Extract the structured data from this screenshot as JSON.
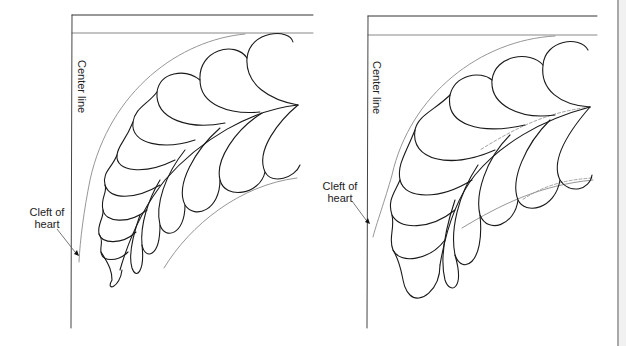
{
  "figure": {
    "panels": [
      {
        "id": "left",
        "center_line_label": "Center line",
        "cleft_label_line1": "Cleft of",
        "cleft_label_line2": "heart"
      },
      {
        "id": "right",
        "center_line_label": "Center line",
        "cleft_label_line1": "Cleft of",
        "cleft_label_line2": "heart"
      }
    ],
    "colors": {
      "ink": "#1a1a1a",
      "guide": "#8a8a8a",
      "dashed": "#999999",
      "background": "#ffffff"
    }
  }
}
